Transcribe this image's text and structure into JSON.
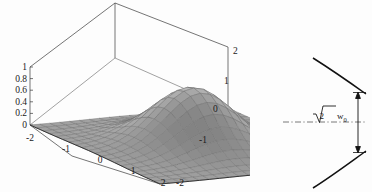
{
  "figure": {
    "panels": [
      {
        "name": "gaussian-surface-plot",
        "type": "surface3d"
      },
      {
        "name": "beam-waist-diagram",
        "type": "schematic"
      }
    ]
  },
  "chart_data": [
    {
      "type": "surface",
      "title": "",
      "xlabel": "",
      "ylabel": "",
      "zlabel": "",
      "description": "3D mesh surface of a two-dimensional Gaussian peak on a square domain, drawn inside a wireframe bounding box",
      "function": "exp(-(x^2+y^2))",
      "xlim": [
        -2,
        2
      ],
      "ylim": [
        -2,
        2
      ],
      "zlim": [
        0,
        1
      ],
      "grid": true,
      "mesh_divisions": 20,
      "z_ticks": [
        "1",
        "0.8",
        "0.6",
        "0.4",
        "0.2",
        "0"
      ],
      "z_tick_values": [
        1,
        0.8,
        0.6,
        0.4,
        0.2,
        0
      ],
      "x_ticks": [
        "-2",
        "-1",
        "0",
        "1",
        "2"
      ],
      "x_tick_values": [
        -2,
        -1,
        0,
        1,
        2
      ],
      "y_ticks": [
        "2",
        "1",
        "0",
        "-1",
        "-2"
      ],
      "y_tick_values": [
        2,
        1,
        0,
        -1,
        -2
      ],
      "surface_fill": "#c9c9c9",
      "surface_line": "#6e6e6e",
      "box_line": "#3a3a3a",
      "peak_value": 1,
      "peak_at": [
        0,
        0
      ]
    },
    {
      "type": "line",
      "title": "",
      "description": "Gaussian beam envelope: two hyperbolic branches symmetric about a dash-dot optical axis, with a double-headed arrow marking the beam diameter at the indicated plane",
      "annotations": [
        {
          "name": "beam-width-label",
          "radical": "√",
          "radicand": "2",
          "symbol": "w",
          "subscript": "0",
          "text": "√2 w₀"
        }
      ],
      "axis_style": "dash-dot",
      "curve_color": "#111111",
      "series": [
        {
          "name": "upper-branch",
          "role": "envelope-upper"
        },
        {
          "name": "lower-branch",
          "role": "envelope-lower"
        }
      ]
    }
  ]
}
